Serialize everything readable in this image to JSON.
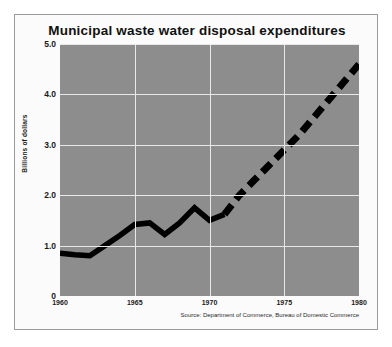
{
  "chart_data": {
    "type": "line",
    "title": "Municipal waste water disposal expenditures",
    "xlabel": "",
    "ylabel": "Billions of dollars",
    "xlim": [
      1960,
      1980
    ],
    "ylim": [
      0,
      5.0
    ],
    "grid": true,
    "legend": false,
    "plot_background_color": "#8d8d8d",
    "gridline_color": "#e8e8e8",
    "series_color": "#000000",
    "source": "Source: Department of Commerce, Bureau of Domestic Commerce",
    "yticks": [
      "0",
      "1.0",
      "2.0",
      "3.0",
      "4.0",
      "5.0"
    ],
    "ytick_values": [
      0,
      1.0,
      2.0,
      3.0,
      4.0,
      5.0
    ],
    "xticks": [
      "1960",
      "1965",
      "1970",
      "1975",
      "1980"
    ],
    "xtick_values": [
      1960,
      1965,
      1970,
      1975,
      1980
    ],
    "series": [
      {
        "name": "Actual expenditures",
        "style": "solid",
        "x": [
          1960,
          1961,
          1962,
          1963,
          1964,
          1965,
          1966,
          1967,
          1968,
          1969,
          1970,
          1971
        ],
        "values": [
          0.85,
          0.82,
          0.8,
          1.0,
          1.2,
          1.42,
          1.45,
          1.22,
          1.45,
          1.75,
          1.5,
          1.62
        ]
      },
      {
        "name": "Projected expenditures",
        "style": "dashed",
        "x": [
          1971,
          1972,
          1973,
          1974,
          1975,
          1976,
          1977,
          1978,
          1979,
          1980
        ],
        "values": [
          1.62,
          2.0,
          2.3,
          2.6,
          2.9,
          3.2,
          3.55,
          3.9,
          4.25,
          4.6
        ]
      }
    ]
  }
}
